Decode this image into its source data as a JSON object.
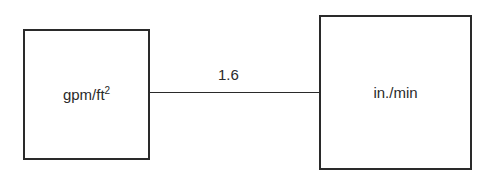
{
  "diagram": {
    "left_box": {
      "label": "gpm/ft",
      "superscript": "2"
    },
    "right_box": {
      "label": "in./min"
    },
    "connector": {
      "label": "1.6"
    }
  }
}
